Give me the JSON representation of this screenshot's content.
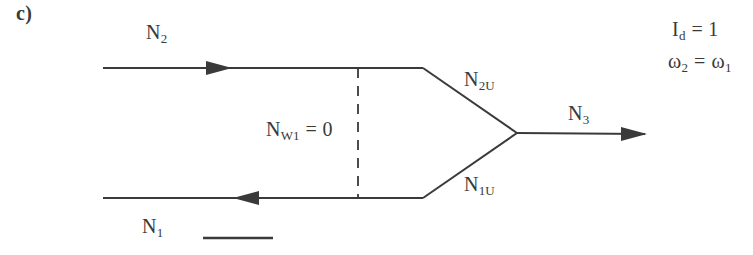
{
  "colors": {
    "ink": "#3a3a3a",
    "background": "#ffffff"
  },
  "panel_label": "c)",
  "labels": {
    "n2": {
      "base": "N",
      "sub": "2"
    },
    "n1": {
      "base": "N",
      "sub": "1"
    },
    "n2u": {
      "base": "N",
      "sub": "2U"
    },
    "n1u": {
      "base": "N",
      "sub": "1U"
    },
    "n3": {
      "base": "N",
      "sub": "3"
    },
    "nw1": {
      "base": "N",
      "sub": "W1",
      "rest": "= 0"
    },
    "id": {
      "base": "I",
      "sub": "d",
      "rest": "= 1"
    },
    "omega": {
      "lhs_base": "ω",
      "lhs_sub": "2",
      "eq": "=",
      "rhs_base": "ω",
      "rhs_sub": "1"
    }
  }
}
